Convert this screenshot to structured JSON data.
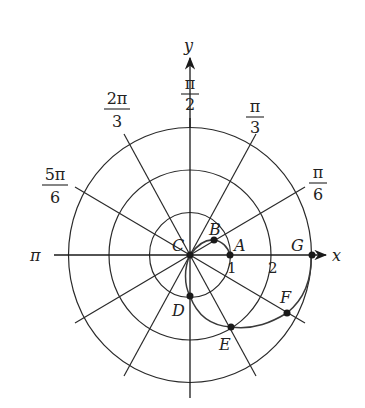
{
  "diagram": {
    "type": "polar-graph",
    "axes": {
      "x_label": "x",
      "y_label": "y",
      "pi_label": "π"
    },
    "angle_labels": [
      {
        "id": "pi-over-2",
        "num": "π",
        "den": "2"
      },
      {
        "id": "pi-over-3",
        "num": "π",
        "den": "3"
      },
      {
        "id": "pi-over-6",
        "num": "π",
        "den": "6"
      },
      {
        "id": "2pi-over-3",
        "num": "2π",
        "den": "3"
      },
      {
        "id": "5pi-over-6",
        "num": "5π",
        "den": "6"
      }
    ],
    "radius_ticks": [
      "1",
      "2"
    ],
    "circles": [
      1,
      2,
      3
    ],
    "points": [
      {
        "name": "A",
        "r": 1,
        "theta": "0"
      },
      {
        "name": "B",
        "r": 0.7,
        "theta": "π/6"
      },
      {
        "name": "C",
        "r": 0,
        "theta": ""
      },
      {
        "name": "D",
        "r": 1,
        "theta": "3π/2"
      },
      {
        "name": "E",
        "r": 2,
        "theta": "5π/3"
      },
      {
        "name": "F",
        "r": 2.75,
        "theta": "11π/6"
      },
      {
        "name": "G",
        "r": 3,
        "theta": "2π"
      }
    ]
  }
}
